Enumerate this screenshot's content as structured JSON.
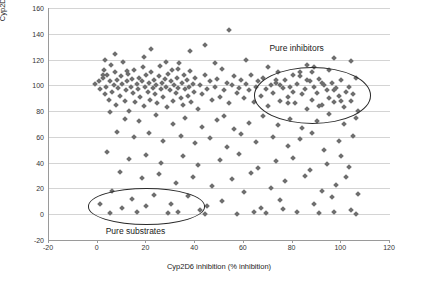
{
  "chart_data": {
    "type": "scatter",
    "title": "",
    "xlabel": "Cyp2D6 inhibition (% inhibition)",
    "ylabel_line1": "Cyp2D6 metabolic stability",
    "ylabel_line2": "(% remaining)",
    "xlim": [
      -20,
      120
    ],
    "ylim": [
      -20,
      160
    ],
    "xticks": [
      -20,
      0,
      20,
      40,
      60,
      80,
      100,
      120
    ],
    "yticks": [
      -20,
      0,
      20,
      40,
      60,
      80,
      100,
      120,
      140,
      160
    ],
    "grid": "horizontal",
    "legend": "none",
    "marker": "diamond",
    "marker_color": "#6e6e6e",
    "annotations": [
      {
        "name": "pure-inhibitors",
        "text": "Pure inhibitors",
        "x": 82,
        "y": 128
      },
      {
        "name": "pure-substrates",
        "text": "Pure substrates",
        "x": 16,
        "y": -14
      }
    ],
    "highlight_regions": [
      {
        "name": "pure-inhibitors-ellipse",
        "cx": 88,
        "cy": 92,
        "rx": 24,
        "ry": 22
      },
      {
        "name": "pure-substrates-ellipse",
        "cx": 20,
        "cy": 6,
        "rx": 24,
        "ry": 14
      }
    ],
    "points": [
      [
        -1,
        101
      ],
      [
        0.5,
        103
      ],
      [
        1,
        97
      ],
      [
        2,
        106
      ],
      [
        2.5,
        112
      ],
      [
        3,
        93
      ],
      [
        3.5,
        99
      ],
      [
        4,
        108
      ],
      [
        4.5,
        89
      ],
      [
        5,
        103
      ],
      [
        5.5,
        116
      ],
      [
        6,
        95
      ],
      [
        6.5,
        100
      ],
      [
        7,
        110
      ],
      [
        7.5,
        85
      ],
      [
        8,
        104
      ],
      [
        8.5,
        98
      ],
      [
        9,
        92
      ],
      [
        9.5,
        107
      ],
      [
        10,
        101
      ],
      [
        10.5,
        118
      ],
      [
        11,
        88
      ],
      [
        11.5,
        96
      ],
      [
        12,
        103
      ],
      [
        12.5,
        109
      ],
      [
        13,
        80
      ],
      [
        13.5,
        99
      ],
      [
        14,
        105
      ],
      [
        14.5,
        94
      ],
      [
        15,
        112
      ],
      [
        15.5,
        87
      ],
      [
        16,
        101
      ],
      [
        16.5,
        97
      ],
      [
        17,
        106
      ],
      [
        17.5,
        91
      ],
      [
        18,
        103
      ],
      [
        18.5,
        114
      ],
      [
        19,
        84
      ],
      [
        19.5,
        99
      ],
      [
        20,
        108
      ],
      [
        20.5,
        95
      ],
      [
        21,
        102
      ],
      [
        21.5,
        89
      ],
      [
        22,
        110
      ],
      [
        22.5,
        98
      ],
      [
        23,
        104
      ],
      [
        23.5,
        93
      ],
      [
        24,
        100
      ],
      [
        24.5,
        86
      ],
      [
        25,
        107
      ],
      [
        25.5,
        115
      ],
      [
        26,
        97
      ],
      [
        26.5,
        102
      ],
      [
        27,
        91
      ],
      [
        27.5,
        105
      ],
      [
        28,
        99
      ],
      [
        28.5,
        83
      ],
      [
        29,
        109
      ],
      [
        29.5,
        96
      ],
      [
        30,
        103
      ],
      [
        30.5,
        112
      ],
      [
        31,
        88
      ],
      [
        31.5,
        100
      ],
      [
        32,
        94
      ],
      [
        32.5,
        106
      ],
      [
        33,
        98
      ],
      [
        33.5,
        117
      ],
      [
        34,
        90
      ],
      [
        34.5,
        102
      ],
      [
        35,
        85
      ],
      [
        35.5,
        108
      ],
      [
        36,
        97
      ],
      [
        36.5,
        104
      ],
      [
        37,
        92
      ],
      [
        37.5,
        99
      ],
      [
        38,
        111
      ],
      [
        38.5,
        87
      ],
      [
        39,
        101
      ],
      [
        39.5,
        95
      ],
      [
        40,
        106
      ],
      [
        41,
        82
      ],
      [
        42,
        100
      ],
      [
        43,
        93
      ],
      [
        44,
        108
      ],
      [
        45,
        97
      ],
      [
        46,
        103
      ],
      [
        47,
        89
      ],
      [
        48,
        99
      ],
      [
        49,
        105
      ],
      [
        50,
        91
      ],
      [
        51,
        113
      ],
      [
        52,
        96
      ],
      [
        53,
        102
      ],
      [
        54,
        86
      ],
      [
        55,
        100
      ],
      [
        56,
        107
      ],
      [
        57,
        94
      ],
      [
        58,
        98
      ],
      [
        59,
        104
      ],
      [
        60,
        90
      ],
      [
        61,
        101
      ],
      [
        62,
        96
      ],
      [
        63,
        108
      ],
      [
        64,
        87
      ],
      [
        65,
        99
      ],
      [
        66,
        103
      ],
      [
        67,
        92
      ],
      [
        68,
        106
      ],
      [
        69,
        97
      ],
      [
        70,
        84
      ],
      [
        71,
        100
      ],
      [
        72,
        94
      ],
      [
        73,
        102
      ],
      [
        74,
        110
      ],
      [
        75,
        88
      ],
      [
        76,
        98
      ],
      [
        77,
        104
      ],
      [
        78,
        91
      ],
      [
        79,
        99
      ],
      [
        80,
        95
      ],
      [
        81,
        86
      ],
      [
        82,
        101
      ],
      [
        83,
        107
      ],
      [
        84,
        93
      ],
      [
        85,
        97
      ],
      [
        86,
        82
      ],
      [
        87,
        103
      ],
      [
        88,
        89
      ],
      [
        89,
        99
      ],
      [
        90,
        94
      ],
      [
        91,
        105
      ],
      [
        92,
        85
      ],
      [
        93,
        100
      ],
      [
        94,
        96
      ],
      [
        95,
        90
      ],
      [
        96,
        102
      ],
      [
        97,
        87
      ],
      [
        98,
        98
      ],
      [
        99,
        92
      ],
      [
        100,
        104
      ],
      [
        101,
        83
      ],
      [
        102,
        95
      ],
      [
        103,
        99
      ],
      [
        104,
        88
      ],
      [
        105,
        93
      ],
      [
        106,
        106
      ],
      [
        107,
        80
      ],
      [
        54,
        143
      ],
      [
        44,
        131
      ],
      [
        22,
        128
      ],
      [
        7,
        124
      ],
      [
        38,
        127
      ],
      [
        61,
        120
      ],
      [
        19,
        122
      ],
      [
        3,
        120
      ],
      [
        28,
        118
      ],
      [
        48,
        117
      ],
      [
        97,
        121
      ],
      [
        104,
        119
      ],
      [
        86,
        116
      ],
      [
        70,
        114
      ],
      [
        33,
        113
      ],
      [
        12,
        111
      ],
      [
        2,
        108
      ],
      [
        52,
        76
      ],
      [
        5,
        79
      ],
      [
        11,
        74
      ],
      [
        17,
        72
      ],
      [
        24,
        77
      ],
      [
        31,
        70
      ],
      [
        36,
        75
      ],
      [
        43,
        68
      ],
      [
        49,
        73
      ],
      [
        56,
        66
      ],
      [
        62,
        71
      ],
      [
        68,
        76
      ],
      [
        74,
        69
      ],
      [
        79,
        74
      ],
      [
        84,
        67
      ],
      [
        90,
        72
      ],
      [
        95,
        78
      ],
      [
        101,
        70
      ],
      [
        106,
        75
      ],
      [
        8,
        64
      ],
      [
        15,
        60
      ],
      [
        21,
        63
      ],
      [
        27,
        57
      ],
      [
        34,
        61
      ],
      [
        40,
        55
      ],
      [
        46,
        59
      ],
      [
        53,
        52
      ],
      [
        59,
        62
      ],
      [
        65,
        56
      ],
      [
        72,
        60
      ],
      [
        78,
        53
      ],
      [
        83,
        58
      ],
      [
        88,
        63
      ],
      [
        93,
        50
      ],
      [
        99,
        57
      ],
      [
        105,
        61
      ],
      [
        4,
        48
      ],
      [
        13,
        43
      ],
      [
        20,
        46
      ],
      [
        26,
        40
      ],
      [
        35,
        45
      ],
      [
        41,
        38
      ],
      [
        50,
        42
      ],
      [
        58,
        47
      ],
      [
        66,
        36
      ],
      [
        73,
        41
      ],
      [
        80,
        44
      ],
      [
        87,
        34
      ],
      [
        94,
        39
      ],
      [
        100,
        45
      ],
      [
        103,
        37
      ],
      [
        9,
        33
      ],
      [
        18,
        28
      ],
      [
        25,
        31
      ],
      [
        32,
        24
      ],
      [
        39,
        29
      ],
      [
        47,
        22
      ],
      [
        55,
        27
      ],
      [
        63,
        32
      ],
      [
        71,
        20
      ],
      [
        77,
        26
      ],
      [
        85,
        30
      ],
      [
        92,
        18
      ],
      [
        98,
        23
      ],
      [
        102,
        29
      ],
      [
        107,
        16
      ],
      [
        6,
        18
      ],
      [
        14,
        12
      ],
      [
        23,
        15
      ],
      [
        30,
        8
      ],
      [
        37,
        14
      ],
      [
        45,
        6
      ],
      [
        51,
        10
      ],
      [
        60,
        17
      ],
      [
        67,
        5
      ],
      [
        75,
        11
      ],
      [
        82,
        2
      ],
      [
        89,
        8
      ],
      [
        96,
        13
      ],
      [
        104,
        3
      ],
      [
        10,
        5
      ],
      [
        16,
        2
      ],
      [
        29,
        1
      ],
      [
        42,
        3
      ],
      [
        57,
        0
      ],
      [
        64,
        2
      ],
      [
        69,
        1
      ],
      [
        76,
        4
      ],
      [
        91,
        1
      ],
      [
        97,
        2
      ],
      [
        106,
        0
      ],
      [
        1,
        8
      ],
      [
        5,
        1
      ],
      [
        20,
        6
      ],
      [
        33,
        2
      ],
      [
        44,
        0
      ],
      [
        88,
        110
      ],
      [
        80,
        108
      ],
      [
        95,
        112
      ],
      [
        78,
        86
      ],
      [
        100,
        88
      ],
      [
        91,
        84
      ],
      [
        83,
        110
      ],
      [
        86,
        104
      ],
      [
        92,
        102
      ],
      [
        97,
        96
      ],
      [
        75,
        100
      ],
      [
        73,
        104
      ],
      [
        89,
        114
      ]
    ]
  }
}
